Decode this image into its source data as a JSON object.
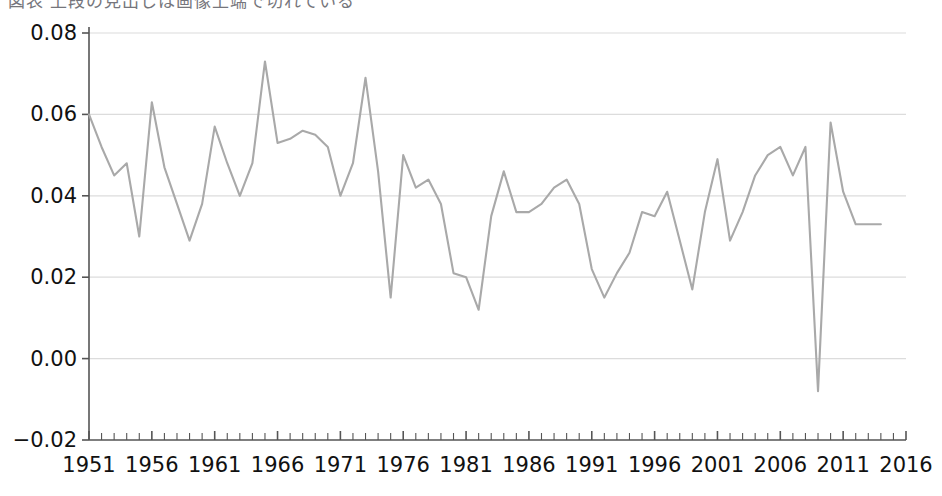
{
  "figure": {
    "background_color": "#ffffff",
    "top_clipped_caption": "図表 上段の見出しは画像上端で切れている",
    "line_color": "#a9a9a9",
    "grid_color": "#dcdcdc",
    "axis_color": "#555555",
    "tick_text_color": "#111111"
  },
  "chart_data": {
    "type": "line",
    "title": "",
    "subtitle": "",
    "xlabel": "",
    "ylabel": "",
    "xlim": [
      1951,
      2016
    ],
    "ylim": [
      -0.02,
      0.08
    ],
    "grid": "horizontal",
    "legend": "none",
    "x_tick_labels": [
      "1951",
      "1956",
      "1961",
      "1966",
      "1971",
      "1976",
      "1981",
      "1986",
      "1991",
      "1996",
      "2001",
      "2006",
      "2011",
      "2016"
    ],
    "x_tick_values": [
      1951,
      1956,
      1961,
      1966,
      1971,
      1976,
      1981,
      1986,
      1991,
      1996,
      2001,
      2006,
      2011,
      2016
    ],
    "x_minor_tick_interval": 1,
    "y_tick_labels": [
      "-0.02",
      "0.00",
      "0.02",
      "0.04",
      "0.06",
      "0.08"
    ],
    "y_tick_values": [
      -0.02,
      0.0,
      0.02,
      0.04,
      0.06,
      0.08
    ],
    "series": [
      {
        "name": "series-1",
        "color": "#a9a9a9",
        "x": [
          1951,
          1952,
          1953,
          1954,
          1955,
          1956,
          1957,
          1958,
          1959,
          1960,
          1961,
          1962,
          1963,
          1964,
          1965,
          1966,
          1967,
          1968,
          1969,
          1970,
          1971,
          1972,
          1973,
          1974,
          1975,
          1976,
          1977,
          1978,
          1979,
          1980,
          1981,
          1982,
          1983,
          1984,
          1985,
          1986,
          1987,
          1988,
          1989,
          1990,
          1991,
          1992,
          1993,
          1994,
          1995,
          1996,
          1997,
          1998,
          1999,
          2000,
          2001,
          2002,
          2003,
          2004,
          2005,
          2006,
          2007,
          2008,
          2009,
          2010,
          2011,
          2012,
          2013,
          2014
        ],
        "y": [
          0.06,
          0.052,
          0.045,
          0.048,
          0.03,
          0.063,
          0.047,
          0.038,
          0.029,
          0.038,
          0.057,
          0.048,
          0.04,
          0.048,
          0.073,
          0.053,
          0.054,
          0.056,
          0.055,
          0.052,
          0.04,
          0.048,
          0.069,
          0.046,
          0.015,
          0.05,
          0.042,
          0.044,
          0.038,
          0.021,
          0.02,
          0.012,
          0.035,
          0.046,
          0.036,
          0.036,
          0.038,
          0.042,
          0.044,
          0.038,
          0.022,
          0.015,
          0.021,
          0.026,
          0.036,
          0.035,
          0.041,
          0.029,
          0.017,
          0.036,
          0.049,
          0.029,
          0.036,
          0.045,
          0.05,
          0.052,
          0.045,
          0.052,
          -0.008,
          0.058,
          0.041,
          0.033,
          0.033,
          0.033
        ]
      }
    ]
  }
}
